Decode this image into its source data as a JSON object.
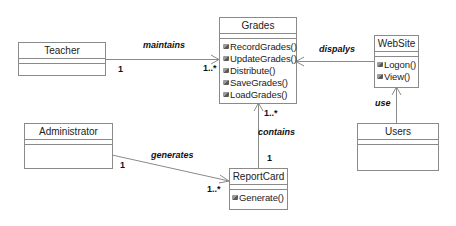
{
  "diagram": {
    "type": "UML class diagram",
    "classes": {
      "teacher": {
        "name": "Teacher",
        "operations": []
      },
      "grades": {
        "name": "Grades",
        "operations": [
          "RecordGrades()",
          "UpdateGrades()",
          "Distribute()",
          "SaveGrades()",
          "LoadGrades()"
        ]
      },
      "website": {
        "name": "WebSite",
        "operations": [
          "Logon()",
          "View()"
        ]
      },
      "users": {
        "name": "Users",
        "operations": []
      },
      "administrator": {
        "name": "Administrator",
        "operations": []
      },
      "reportcard": {
        "name": "ReportCard",
        "operations": [
          "Generate()"
        ]
      }
    },
    "associations": {
      "maintains": {
        "label": "maintains",
        "from": "Teacher",
        "to": "Grades",
        "from_mult": "1",
        "to_mult": "1..*"
      },
      "displays": {
        "label": "dispalys",
        "from": "WebSite",
        "to": "Grades"
      },
      "use": {
        "label": "use",
        "from": "Users",
        "to": "WebSite"
      },
      "contains": {
        "label": "contains",
        "from": "ReportCard",
        "to": "Grades",
        "from_mult": "1",
        "to_mult": "1..*"
      },
      "generates": {
        "label": "generates",
        "from": "Administrator",
        "to": "ReportCard",
        "from_mult": "1",
        "to_mult": "1..*"
      }
    }
  }
}
